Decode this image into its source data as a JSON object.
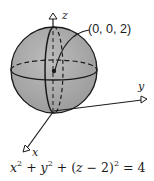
{
  "figure": {
    "type": "3d-sphere-diagram",
    "point_label": "(0, 0, 2)",
    "axes": {
      "x": "x",
      "y": "y",
      "z": "z"
    },
    "equation": {
      "text": "x² + y² + (z − 2)² = 4",
      "parts": {
        "x": "x",
        "y": "y",
        "z": "z",
        "exp": "2",
        "center": "2",
        "rhs": "4"
      }
    },
    "colors": {
      "sphere_fill": "#a9a9a9",
      "stroke": "#1a1a1a",
      "background": "#ffffff"
    }
  }
}
